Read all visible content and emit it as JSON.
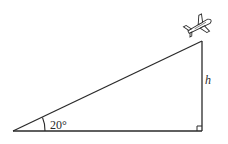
{
  "diagram": {
    "angle_label": "20°",
    "height_label": "h",
    "right_angle_marker": true,
    "object": "airplane",
    "colors": {
      "stroke": "#2a2a2a",
      "background": "#ffffff"
    }
  }
}
